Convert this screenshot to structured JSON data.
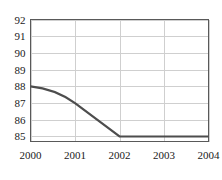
{
  "chart_data": {
    "type": "line",
    "title": "",
    "subtitle": "",
    "xlabel": "",
    "ylabel": "",
    "x": [
      2000,
      2001,
      2002,
      2003,
      2004
    ],
    "series": [
      {
        "name": "series-1",
        "values": [
          88,
          87,
          85,
          85,
          85
        ],
        "color": "#4d4d4d"
      }
    ],
    "xlim": [
      2000,
      2004
    ],
    "ylim": [
      84.7,
      92
    ],
    "xticks": [
      2000,
      2001,
      2002,
      2003,
      2004
    ],
    "xtick_labels": [
      "2000",
      "2001",
      "2002",
      "2003",
      "2004"
    ],
    "yticks": [
      85,
      86,
      87,
      88,
      89,
      90,
      91,
      92
    ],
    "ytick_labels": [
      "85",
      "86",
      "87",
      "88",
      "89",
      "90",
      "91",
      "92"
    ],
    "grid": {
      "horizontal": true,
      "vertical": true,
      "color": "#cfcfcf"
    },
    "legend": {
      "visible": false,
      "position": "none",
      "entries": []
    },
    "annotations": [],
    "frame_color": "#595959",
    "background_color": "#ffffff",
    "line_shape": "smooth-then-linear"
  }
}
